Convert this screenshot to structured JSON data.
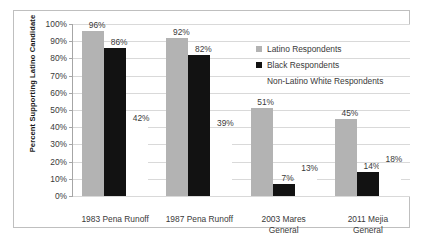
{
  "chart_data": {
    "type": "bar",
    "title": "",
    "subtitle": "",
    "xlabel": "",
    "ylabel": "Percent Supporting Latino Candidate",
    "ylim": [
      0,
      100
    ],
    "ytick_labels": [
      "0%",
      "10%",
      "20%",
      "30%",
      "40%",
      "50%",
      "60%",
      "70%",
      "80%",
      "90%",
      "100%"
    ],
    "ytick_values": [
      0,
      10,
      20,
      30,
      40,
      50,
      60,
      70,
      80,
      90,
      100
    ],
    "grid": true,
    "legend_position": "inside-top-right",
    "categories": [
      "1983 Pena Runoff",
      "1987 Pena Runoff",
      "2003 Mares General",
      "2011 Mejia General"
    ],
    "category_lines": [
      [
        "1983 Pena Runoff"
      ],
      [
        "1987 Pena Runoff"
      ],
      [
        "2003 Mares",
        "General"
      ],
      [
        "2011 Mejia",
        "General"
      ]
    ],
    "series": [
      {
        "name": "Latino Respondents",
        "color": "#b3b3b3",
        "values": [
          96,
          92,
          51,
          45
        ],
        "labels": [
          "96%",
          "92%",
          "51%",
          "45%"
        ]
      },
      {
        "name": "Black Respondents",
        "color": "#121212",
        "values": [
          86,
          82,
          7,
          14
        ],
        "labels": [
          "86%",
          "82%",
          "7%",
          "14%"
        ]
      },
      {
        "name": "Non-Latino White Respondents",
        "color": "#ffffff",
        "values": [
          42,
          39,
          13,
          18
        ],
        "labels": [
          "42%",
          "39%",
          "13%",
          "18%"
        ]
      }
    ]
  },
  "legend": {
    "items": [
      {
        "label": "Latino Respondents",
        "swatch": "latino"
      },
      {
        "label": "Black Respondents",
        "swatch": "black"
      },
      {
        "label": "Non-Latino White Respondents",
        "swatch": "white"
      }
    ]
  }
}
